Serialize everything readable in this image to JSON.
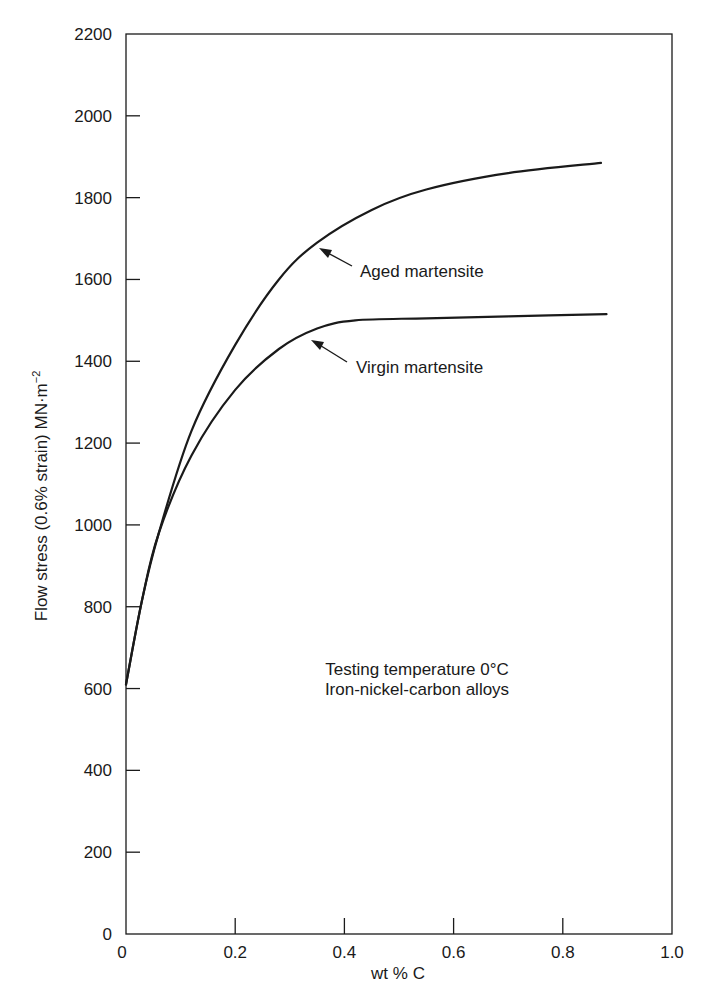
{
  "chart_data": {
    "type": "line",
    "title": "",
    "xlabel": "wt % C",
    "ylabel": "Flow stress (0.6% strain) MN·m⁻²",
    "xlim": [
      0,
      1.0
    ],
    "ylim": [
      0,
      2200
    ],
    "xticks": [
      "0",
      "0.2",
      "0.4",
      "0.6",
      "0.8",
      "1.0"
    ],
    "xtick_values": [
      0,
      0.2,
      0.4,
      0.6,
      0.8,
      1.0
    ],
    "yticks": [
      "0",
      "200",
      "400",
      "600",
      "800",
      "1000",
      "1200",
      "1400",
      "1600",
      "1800",
      "2000",
      "2200"
    ],
    "ytick_values": [
      0,
      200,
      400,
      600,
      800,
      1000,
      1200,
      1400,
      1600,
      1800,
      2000,
      2200
    ],
    "grid": false,
    "legend": "none (curves labelled with arrow annotations)",
    "series": [
      {
        "name": "Aged martensite",
        "x": [
          0,
          0.03,
          0.06,
          0.12,
          0.2,
          0.28,
          0.35,
          0.45,
          0.55,
          0.7,
          0.87
        ],
        "y": [
          610,
          820,
          980,
          1230,
          1440,
          1600,
          1690,
          1770,
          1820,
          1860,
          1885
        ]
      },
      {
        "name": "Virgin martensite",
        "x": [
          0,
          0.03,
          0.06,
          0.12,
          0.2,
          0.28,
          0.35,
          0.42,
          0.55,
          0.7,
          0.88
        ],
        "y": [
          610,
          820,
          980,
          1170,
          1330,
          1430,
          1480,
          1500,
          1505,
          1510,
          1515
        ]
      }
    ],
    "annotations": [
      {
        "text": "Aged martensite",
        "arrow_to": {
          "x": 0.36,
          "y": 1680
        }
      },
      {
        "text": "Virgin martensite",
        "arrow_to": {
          "x": 0.34,
          "y": 1460
        }
      },
      {
        "text": "Testing temperature 0°C"
      },
      {
        "text": "Iron-nickel-carbon alloys"
      }
    ]
  },
  "labels": {
    "aged": "Aged martensite",
    "virgin": "Virgin martensite",
    "note_line1": "Testing temperature 0°C",
    "note_line2": "Iron-nickel-carbon alloys",
    "xlabel": "wt % C",
    "ylabel_main": "Flow stress (0.6% strain) MN·m",
    "ylabel_sup": "−2"
  },
  "colors": {
    "ink": "#1a1a1a",
    "background": "#ffffff"
  }
}
